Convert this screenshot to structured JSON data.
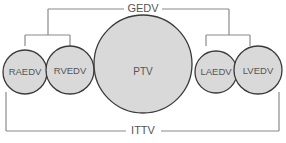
{
  "diagram": {
    "type": "nested-volume-brackets",
    "top_bracket": {
      "label": "GEDV",
      "groups": [
        "RAEDV+RVEDV",
        "LAEDV+LVEDV"
      ]
    },
    "bottom_bracket": {
      "label": "ITTV",
      "spans": "all"
    },
    "nodes": [
      {
        "id": "raedv",
        "label": "RAEDV",
        "cx": 25,
        "cy": 72,
        "r": 22
      },
      {
        "id": "rvedv",
        "label": "RVEDV",
        "cx": 70,
        "cy": 70,
        "r": 24
      },
      {
        "id": "ptv",
        "label": "PTV",
        "cx": 143,
        "cy": 64,
        "r": 49
      },
      {
        "id": "laedv",
        "label": "LAEDV",
        "cx": 216,
        "cy": 72,
        "r": 21
      },
      {
        "id": "lvedv",
        "label": "LVEDV",
        "cx": 258,
        "cy": 70,
        "r": 24
      }
    ],
    "colors": {
      "circle_fill": "#d9d9d9",
      "circle_stroke": "#3a3a3a",
      "line": "#8a8a8a",
      "text": "#555555"
    }
  }
}
